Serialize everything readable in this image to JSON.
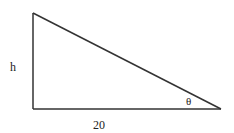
{
  "diagram": {
    "type": "right-triangle",
    "labels": {
      "height": "h",
      "base": "20",
      "angle": "θ"
    },
    "colors": {
      "stroke": "#333333",
      "text": "#222222"
    }
  }
}
